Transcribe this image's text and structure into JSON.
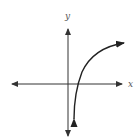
{
  "graph": {
    "x_axis_label": "x",
    "y_axis_label": "y",
    "curve_type": "logarithmic",
    "curve_description": "increasing curve with vertical asymptote near y-axis, crossing x-axis just right of origin",
    "colors": {
      "axis": "#333333",
      "curve": "#222222",
      "background": "#ffffff"
    }
  }
}
